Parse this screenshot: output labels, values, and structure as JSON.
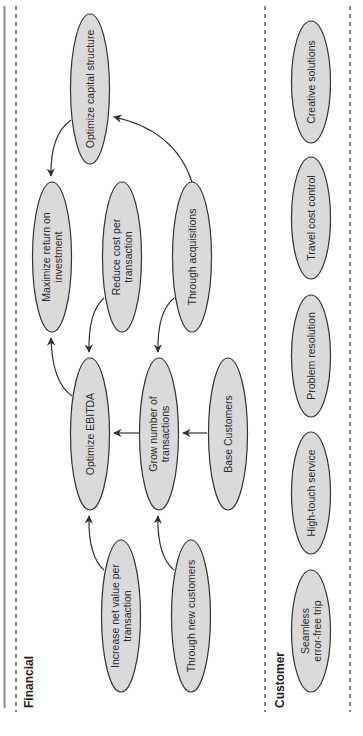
{
  "diagram": {
    "orientation": "rotated-90-counterclockwise",
    "colors": {
      "node_fill": "#dadada",
      "node_stroke": "#333333",
      "arrow": "#333333",
      "border_solid": "#8a8a8a",
      "divider_dashed": "#333333"
    },
    "sections": [
      {
        "id": "financial",
        "label": "Financial",
        "nodes": [
          {
            "id": "capital",
            "lines": [
              "Optimize capital structure"
            ]
          },
          {
            "id": "roi",
            "lines": [
              "Maximize return on",
              "investment"
            ]
          },
          {
            "id": "reduce_cost",
            "lines": [
              "Reduce cost per",
              "transaction"
            ]
          },
          {
            "id": "acquisitions",
            "lines": [
              "Through acquisitions"
            ]
          },
          {
            "id": "ebitda",
            "lines": [
              "Optimize EBITDA"
            ]
          },
          {
            "id": "grow",
            "lines": [
              "Grow number of",
              "transactions"
            ]
          },
          {
            "id": "base",
            "lines": [
              "Base Customers"
            ]
          },
          {
            "id": "net_value",
            "lines": [
              "Increase net value per",
              "transaction"
            ]
          },
          {
            "id": "new_customers",
            "lines": [
              "Through new customers"
            ]
          }
        ],
        "edges": [
          {
            "from": "capital",
            "to": "roi"
          },
          {
            "from": "acquisitions",
            "to": "capital"
          },
          {
            "from": "reduce_cost",
            "to": "ebitda"
          },
          {
            "from": "acquisitions",
            "to": "grow"
          },
          {
            "from": "ebitda",
            "to": "roi"
          },
          {
            "from": "grow",
            "to": "ebitda"
          },
          {
            "from": "base",
            "to": "grow"
          },
          {
            "from": "net_value",
            "to": "ebitda"
          },
          {
            "from": "new_customers",
            "to": "grow"
          }
        ]
      },
      {
        "id": "customer",
        "label": "Customer",
        "nodes": [
          {
            "id": "creative",
            "lines": [
              "Creative solutions"
            ]
          },
          {
            "id": "travel_cost",
            "lines": [
              "Travel cost control"
            ]
          },
          {
            "id": "problem",
            "lines": [
              "Problem resolution"
            ]
          },
          {
            "id": "high_touch",
            "lines": [
              "High-touch service"
            ]
          },
          {
            "id": "seamless",
            "lines": [
              "Seamless",
              "error-free trip"
            ]
          }
        ]
      }
    ]
  }
}
